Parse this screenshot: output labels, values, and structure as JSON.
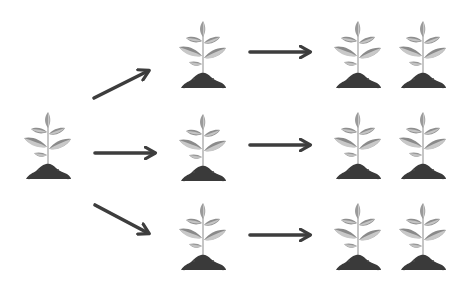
{
  "diagram": {
    "type": "propagation-flow",
    "colors": {
      "leaf_dark": "#8f8f8f",
      "leaf_light": "#c4c4c4",
      "stem": "#b5b5b5",
      "soil": "#3a3a3a",
      "arrow": "#3d3d3d",
      "background": "#ffffff"
    },
    "nodes": [
      {
        "id": "source",
        "label": "",
        "stage": 0,
        "x": 23,
        "y": 108
      },
      {
        "id": "gen1-top",
        "label": "",
        "stage": 1,
        "x": 178,
        "y": 17
      },
      {
        "id": "gen1-middle",
        "label": "",
        "stage": 1,
        "x": 178,
        "y": 110
      },
      {
        "id": "gen1-bottom",
        "label": "",
        "stage": 1,
        "x": 178,
        "y": 199
      },
      {
        "id": "gen2-top-a",
        "label": "",
        "stage": 2,
        "x": 333,
        "y": 17
      },
      {
        "id": "gen2-top-b",
        "label": "",
        "stage": 2,
        "x": 398,
        "y": 17
      },
      {
        "id": "gen2-middle-a",
        "label": "",
        "stage": 2,
        "x": 333,
        "y": 108
      },
      {
        "id": "gen2-middle-b",
        "label": "",
        "stage": 2,
        "x": 398,
        "y": 108
      },
      {
        "id": "gen2-bottom-a",
        "label": "",
        "stage": 2,
        "x": 333,
        "y": 199
      },
      {
        "id": "gen2-bottom-b",
        "label": "",
        "stage": 2,
        "x": 398,
        "y": 199
      }
    ],
    "edges": [
      {
        "from": "source",
        "to": "gen1-top",
        "direction": "up-right"
      },
      {
        "from": "source",
        "to": "gen1-middle",
        "direction": "right"
      },
      {
        "from": "source",
        "to": "gen1-bottom",
        "direction": "down-right"
      },
      {
        "from": "gen1-top",
        "to": "gen2-top",
        "direction": "right"
      },
      {
        "from": "gen1-middle",
        "to": "gen2-middle",
        "direction": "right"
      },
      {
        "from": "gen1-bottom",
        "to": "gen2-bottom",
        "direction": "right"
      }
    ],
    "icons": {
      "plant": "seedling-in-soil-icon",
      "arrow": "arrow-right-icon"
    }
  }
}
